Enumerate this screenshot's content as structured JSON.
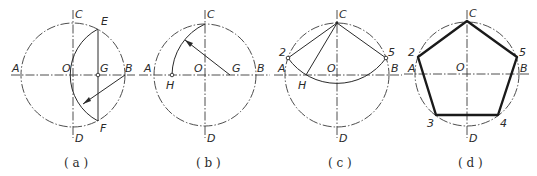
{
  "figure": {
    "colors": {
      "line": "#2a2a2a",
      "background": "#ffffff"
    },
    "panels": [
      {
        "id": "a",
        "caption": "( a )",
        "labels": {
          "A": "A",
          "B": "B",
          "C": "C",
          "D": "D",
          "O": "O",
          "E": "E",
          "F": "F",
          "G": "G"
        }
      },
      {
        "id": "b",
        "caption": "( b )",
        "labels": {
          "A": "A",
          "B": "B",
          "C": "C",
          "D": "D",
          "O": "O",
          "G": "G",
          "H": "H"
        }
      },
      {
        "id": "c",
        "caption": "( c )",
        "labels": {
          "A": "A",
          "B": "B",
          "C": "C",
          "D": "D",
          "O": "O",
          "H": "H",
          "p2": "2",
          "p5": "5"
        }
      },
      {
        "id": "d",
        "caption": "( d )",
        "labels": {
          "A": "A",
          "B": "B",
          "C": "C",
          "D": "D",
          "O": "O",
          "p2": "2",
          "p3": "3",
          "p4": "4",
          "p5": "5"
        }
      }
    ]
  }
}
